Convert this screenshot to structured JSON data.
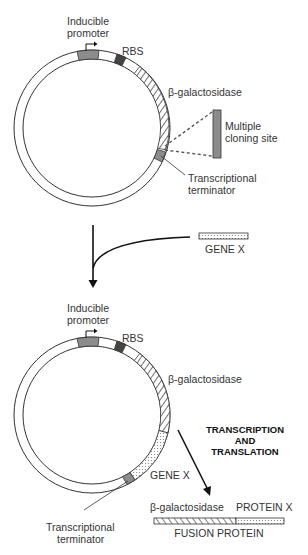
{
  "top_plasmid": {
    "promoter_label_line1": "Inducible",
    "promoter_label_line2": "promoter",
    "rbs_label": "RBS",
    "lacz_label": "β-galactosidase",
    "mcs_label_line1": "Multiple",
    "mcs_label_line2": "cloning site",
    "terminator_label_line1": "Transcriptional",
    "terminator_label_line2": "terminator"
  },
  "insert": {
    "gene_label": "GENE X"
  },
  "bottom_plasmid": {
    "promoter_label_line1": "Inducible",
    "promoter_label_line2": "promoter",
    "rbs_label": "RBS",
    "lacz_label": "β-galactosidase",
    "gene_label": "GENE X",
    "terminator_label_line1": "Transcriptional",
    "terminator_label_line2": "terminator"
  },
  "process": {
    "line1": "TRANSCRIPTION",
    "line2": "AND",
    "line3": "TRANSLATION"
  },
  "product": {
    "lacz_label": "β-galactosidase",
    "protein_label": "PROTEIN X",
    "fusion_label": "FUSION PROTEIN"
  },
  "colors": {
    "promoter": "#8c8c8c",
    "rbs": "#444444",
    "terminator": "#8c8c8c",
    "mcs": "#8c8c8c",
    "outline": "#333333"
  }
}
